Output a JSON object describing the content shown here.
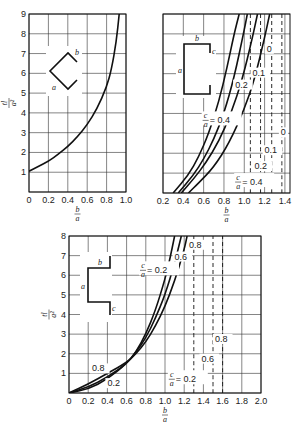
{
  "chart_data": [
    {
      "id": "top-left",
      "type": "line",
      "title": "",
      "xlabel": "b/a",
      "ylabel": "tl/a^2",
      "xlim": [
        0,
        1.0
      ],
      "ylim": [
        0,
        9
      ],
      "grid": true,
      "xticks": [
        "0",
        "0.2",
        "0.4",
        "0.6",
        "0.8",
        "1.0"
      ],
      "yticks": [
        "1",
        "2",
        "3",
        "4",
        "5",
        "6",
        "7",
        "8",
        "9"
      ],
      "section_sketch": {
        "shape": "angle (two legs)",
        "labels": [
          "a",
          "b"
        ]
      },
      "series": [
        {
          "name": "curve",
          "style": "solid",
          "x": [
            0,
            0.1,
            0.2,
            0.3,
            0.4,
            0.5,
            0.6,
            0.7,
            0.8,
            0.85,
            0.9,
            0.93
          ],
          "y": [
            1.05,
            1.3,
            1.55,
            1.9,
            2.3,
            2.8,
            3.4,
            4.2,
            5.3,
            6.2,
            7.6,
            9.0
          ]
        }
      ]
    },
    {
      "id": "top-right",
      "type": "line",
      "title": "",
      "xlabel": "b/a",
      "ylabel": "",
      "xlim": [
        0.2,
        1.45
      ],
      "ylim": [
        0,
        9
      ],
      "grid": true,
      "xticks": [
        "0.2",
        "0.4",
        "0.6",
        "0.8",
        "1.0",
        "1.2",
        "1.4"
      ],
      "yticks": [],
      "section_sketch": {
        "shape": "channel with lips",
        "labels": [
          "a",
          "b",
          "c"
        ]
      },
      "series": [
        {
          "name": "c/a = 0.4",
          "style": "solid",
          "x": [
            0.3,
            0.45,
            0.55,
            0.65,
            0.75,
            0.83,
            0.9,
            0.95
          ],
          "y": [
            0,
            0.9,
            1.8,
            3.0,
            4.6,
            6.3,
            8.0,
            9.0
          ]
        },
        {
          "name": "0.2",
          "style": "solid",
          "x": [
            0.35,
            0.5,
            0.6,
            0.7,
            0.8,
            0.9,
            1.0,
            1.03
          ],
          "y": [
            0,
            0.9,
            1.7,
            2.7,
            4.0,
            5.8,
            8.2,
            9.0
          ]
        },
        {
          "name": "0.1",
          "style": "solid",
          "x": [
            0.38,
            0.5,
            0.62,
            0.75,
            0.87,
            0.98,
            1.08,
            1.13
          ],
          "y": [
            0,
            0.7,
            1.5,
            2.6,
            4.0,
            5.7,
            7.8,
            9.0
          ]
        },
        {
          "name": "0",
          "style": "solid",
          "x": [
            0.45,
            0.55,
            0.7,
            0.85,
            1.0,
            1.1,
            1.2,
            1.25
          ],
          "y": [
            0,
            0.5,
            1.3,
            2.5,
            4.2,
            5.7,
            7.8,
            9.0
          ]
        },
        {
          "name": "limit c/a = 0.4",
          "style": "dashed",
          "x": [
            1.06,
            1.06
          ],
          "y": [
            0,
            9
          ]
        },
        {
          "name": "limit 0.2",
          "style": "dashed",
          "x": [
            1.16,
            1.16
          ],
          "y": [
            0,
            9
          ]
        },
        {
          "name": "limit 0.1",
          "style": "dashed",
          "x": [
            1.27,
            1.27
          ],
          "y": [
            0,
            9
          ]
        },
        {
          "name": "limit 0",
          "style": "dashed",
          "x": [
            1.37,
            1.37
          ],
          "y": [
            0,
            9
          ]
        }
      ],
      "annotations": [
        {
          "text": "0",
          "x": 1.22,
          "y": 7.1
        },
        {
          "text": "0.1",
          "x": 1.08,
          "y": 5.9
        },
        {
          "text": "0.2",
          "x": 0.91,
          "y": 5.3
        },
        {
          "text": "c/a = 0.4",
          "x": 0.6,
          "y": 3.6
        },
        {
          "text": "0",
          "x": 1.36,
          "y": 2.9
        },
        {
          "text": "0.1",
          "x": 1.2,
          "y": 2.0
        },
        {
          "text": "0.2",
          "x": 1.1,
          "y": 1.2
        },
        {
          "text": "c/a = 0.4",
          "x": 0.92,
          "y": 0.5
        }
      ]
    },
    {
      "id": "bottom",
      "type": "line",
      "title": "",
      "xlabel": "b/a",
      "ylabel": "tl/a^2",
      "xlim": [
        0,
        2.0
      ],
      "ylim": [
        0,
        8
      ],
      "grid": true,
      "xticks": [
        "0",
        "0.2",
        "0.4",
        "0.6",
        "0.8",
        "1.0",
        "1.2",
        "1.4",
        "1.6",
        "1.8",
        "2.0"
      ],
      "yticks": [
        "1",
        "2",
        "3",
        "4",
        "5",
        "6",
        "7",
        "8"
      ],
      "section_sketch": {
        "shape": "Z-section with lips",
        "labels": [
          "a",
          "b",
          "c"
        ]
      },
      "series": [
        {
          "name": "c/a = 0.2",
          "style": "solid",
          "x": [
            0,
            0.2,
            0.4,
            0.6,
            0.7,
            0.8,
            0.9,
            1.0,
            1.05,
            1.1
          ],
          "y": [
            0,
            0.2,
            0.7,
            1.5,
            2.1,
            3.0,
            4.2,
            5.8,
            6.8,
            8.0
          ]
        },
        {
          "name": "0.6",
          "style": "solid",
          "x": [
            0,
            0.2,
            0.4,
            0.6,
            0.7,
            0.8,
            0.9,
            1.0,
            1.1,
            1.17
          ],
          "y": [
            0,
            0.3,
            0.8,
            1.5,
            2.1,
            2.8,
            3.8,
            5.0,
            6.6,
            8.0
          ]
        },
        {
          "name": "0.8",
          "style": "solid",
          "x": [
            0,
            0.2,
            0.4,
            0.6,
            0.7,
            0.8,
            0.9,
            1.0,
            1.1,
            1.2,
            1.23
          ],
          "y": [
            0,
            0.45,
            1.0,
            1.55,
            2.0,
            2.6,
            3.4,
            4.4,
            5.7,
            7.3,
            8.0
          ]
        },
        {
          "name": "limit c/a = 0.2",
          "style": "dashed",
          "x": [
            1.3,
            1.3
          ],
          "y": [
            0,
            8
          ]
        },
        {
          "name": "limit 0.6",
          "style": "dashed",
          "x": [
            1.5,
            1.5
          ],
          "y": [
            0,
            8
          ]
        },
        {
          "name": "limit 0.8",
          "style": "dashed",
          "x": [
            1.6,
            1.6
          ],
          "y": [
            0,
            8
          ]
        }
      ],
      "annotations": [
        {
          "text": "0.8",
          "x": 1.25,
          "y": 7.4
        },
        {
          "text": "0.6",
          "x": 1.1,
          "y": 6.8
        },
        {
          "text": "c/a = 0.2",
          "x": 0.75,
          "y": 6.2
        },
        {
          "text": "0.8",
          "x": 1.52,
          "y": 2.6
        },
        {
          "text": "0.6",
          "x": 1.38,
          "y": 1.6
        },
        {
          "text": "c/a = 0.2",
          "x": 1.05,
          "y": 0.65
        },
        {
          "text": "0.8",
          "x": 0.24,
          "y": 1.1
        },
        {
          "text": "0.2",
          "x": 0.4,
          "y": 0.35
        }
      ]
    }
  ],
  "frames": [
    {
      "x0": 29,
      "x1": 126,
      "y0": 192,
      "y1": 14,
      "xticks_px_step": 19.4,
      "vgrid": 5,
      "hgrid": 9
    },
    {
      "x0": 163,
      "x1": 290,
      "y0": 193,
      "y1": 14,
      "vgrid_start": 0.2,
      "vgrid_step": 0.1,
      "hgrid": 9
    },
    {
      "x0": 69,
      "x1": 261,
      "y0": 393,
      "y1": 236,
      "vgrid": 10,
      "hgrid": 8
    }
  ],
  "sketch_labels": {
    "a": "a",
    "b": "b",
    "c": "c"
  },
  "axis_labels": {
    "num_b": "b",
    "den_a": "a",
    "y_num": "tl",
    "y_den": "a²"
  }
}
